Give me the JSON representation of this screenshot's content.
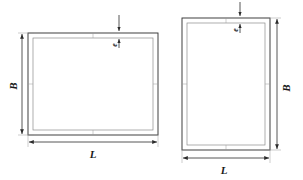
{
  "figure": {
    "background_color": "#ffffff",
    "line_color": "#2b2b2b",
    "inner_line_color": "#8c8c8c",
    "dimension_line_color": "#3a3a3a",
    "width_px": 303,
    "height_px": 180,
    "view_count": 2
  },
  "views": [
    {
      "id": "landscape-frame",
      "name": "Landscape rectangular frame",
      "orientation": "landscape",
      "outer": {
        "x": 28,
        "y": 33,
        "w": 130,
        "h": 102
      },
      "wall_thickness_px": 5,
      "dimensions": [
        {
          "id": "left-height",
          "symbol": "B",
          "meaning": "Frame outside height",
          "placement": "left",
          "rotated": true,
          "line": {
            "x1": 22,
            "y1": 33,
            "x2": 22,
            "y2": 135
          },
          "label_pos": {
            "x": 14,
            "y": 86
          }
        },
        {
          "id": "bottom-width",
          "symbol": "L",
          "meaning": "Frame outside length",
          "placement": "bottom",
          "rotated": false,
          "line": {
            "x1": 28,
            "y1": 142,
            "x2": 158,
            "y2": 142
          },
          "label_pos": {
            "x": 93,
            "y": 156
          }
        },
        {
          "id": "top-thickness",
          "symbol": "e",
          "meaning": "Wall thickness",
          "placement": "top",
          "rotated": false,
          "leader": {
            "x": 119,
            "y_top": 14,
            "y_bottom": 40
          },
          "label_pos": {
            "x": 116,
            "y": 44
          }
        }
      ]
    },
    {
      "id": "portrait-frame",
      "name": "Portrait rectangular frame",
      "orientation": "portrait",
      "outer": {
        "x": 182,
        "y": 18,
        "w": 88,
        "h": 132
      },
      "wall_thickness_px": 5,
      "dimensions": [
        {
          "id": "right-height",
          "symbol": "B",
          "meaning": "Frame outside height",
          "placement": "right",
          "rotated": true,
          "line": {
            "x1": 277,
            "y1": 18,
            "x2": 277,
            "y2": 150
          },
          "label_pos": {
            "x": 286,
            "y": 88
          }
        },
        {
          "id": "bottom-width",
          "symbol": "L",
          "meaning": "Frame outside length",
          "placement": "bottom",
          "rotated": false,
          "line": {
            "x1": 182,
            "y1": 158,
            "x2": 270,
            "y2": 158
          },
          "label_pos": {
            "x": 224,
            "y": 172
          }
        },
        {
          "id": "top-thickness",
          "symbol": "e",
          "meaning": "Wall thickness",
          "placement": "top",
          "rotated": false,
          "leader": {
            "x": 240,
            "y_top": 2,
            "y_bottom": 26
          },
          "label_pos": {
            "x": 238,
            "y": 30
          }
        }
      ]
    }
  ],
  "symbols": {
    "length": "L",
    "breadth": "B",
    "thickness": "e"
  }
}
